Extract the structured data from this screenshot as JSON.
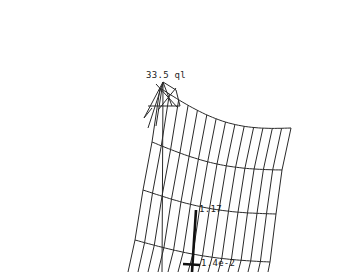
{
  "diagram": {
    "type": "deformed-shell-mesh",
    "line_color": "#2a2a2a",
    "background": "#ffffff",
    "labels": {
      "load": "33.5 ql",
      "upper_value": "1.17",
      "lower_value": "1.4e-2"
    },
    "mesh": {
      "columns": 14,
      "rows": [
        {
          "left": [
            160,
            88
          ],
          "right": [
            291,
            128
          ]
        },
        {
          "left": [
            152,
            142
          ],
          "right": [
            282,
            170
          ]
        },
        {
          "left": [
            143,
            190
          ],
          "right": [
            276,
            214
          ]
        },
        {
          "left": [
            135,
            240
          ],
          "right": [
            270,
            262
          ]
        }
      ],
      "bottom": {
        "left": [
          128,
          272
        ],
        "right": [
          268,
          272
        ]
      }
    }
  }
}
